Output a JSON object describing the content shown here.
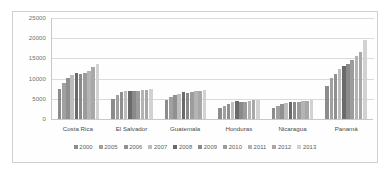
{
  "chart_data": {
    "type": "bar",
    "title": "",
    "subtitle": "",
    "xlabel": "",
    "ylabel": "",
    "ylim": [
      0,
      25000
    ],
    "yticks": [
      0,
      5000,
      10000,
      15000,
      20000,
      25000
    ],
    "ytick_labels": [
      "0",
      "5000",
      "10000",
      "15000",
      "20000",
      "25000"
    ],
    "grid": true,
    "legend_position": "bottom",
    "categories": [
      "Costa Rica",
      "El Salvador",
      "Guatemala",
      "Honduras",
      "Nicaragua",
      "Panamá"
    ],
    "series": [
      {
        "name": "2000",
        "color": "#8c8c8c",
        "values": [
          7400,
          4900,
          4800,
          2700,
          2800,
          8200
        ]
      },
      {
        "name": "2005",
        "color": "#a0a0a0",
        "values": [
          9000,
          6000,
          5400,
          3300,
          3300,
          10200
        ]
      },
      {
        "name": "2006",
        "color": "#909090",
        "values": [
          10200,
          6600,
          5900,
          3700,
          3700,
          11100
        ]
      },
      {
        "name": "2007",
        "color": "#bdbdbd",
        "values": [
          11000,
          6900,
          6300,
          4100,
          3900,
          12300
        ]
      },
      {
        "name": "2008",
        "color": "#6a6a6a",
        "values": [
          11400,
          7000,
          6600,
          4400,
          4100,
          13200
        ]
      },
      {
        "name": "2009",
        "color": "#8a8a8a",
        "values": [
          11200,
          6900,
          6500,
          4200,
          4200,
          13700
        ]
      },
      {
        "name": "2010",
        "color": "#9c9c9c",
        "values": [
          11400,
          7000,
          6700,
          4300,
          4300,
          14500
        ]
      },
      {
        "name": "2011",
        "color": "#b4b4b4",
        "values": [
          11900,
          7100,
          6900,
          4500,
          4400,
          15500
        ]
      },
      {
        "name": "2012",
        "color": "#a8a8a8",
        "values": [
          12900,
          7300,
          7000,
          4600,
          4500,
          16600
        ]
      },
      {
        "name": "2013",
        "color": "#d2d2d2",
        "values": [
          13700,
          7500,
          7200,
          4700,
          4700,
          19500
        ]
      }
    ]
  },
  "legend": {
    "items": [
      "2000",
      "2005",
      "2006",
      "2007",
      "2008",
      "2009",
      "2010",
      "2011",
      "2012",
      "2013"
    ]
  },
  "colors": {
    "frame_border": "#d0d0d0",
    "gridline": "#dadada",
    "axis": "#c8c8c8",
    "tick_text": "#6e6e6e",
    "category_text": "#4a4a4a",
    "legend_text": "#5a5a5a",
    "plot_background": "#fefefe"
  }
}
